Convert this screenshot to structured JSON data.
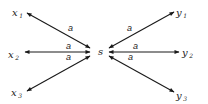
{
  "diagram": {
    "type": "bipartite-star-graph",
    "center": {
      "id": "s",
      "label": "s"
    },
    "nodes": [
      {
        "id": "x1",
        "base": "x",
        "sub": "1",
        "side": "left"
      },
      {
        "id": "x2",
        "base": "x",
        "sub": "2",
        "side": "left"
      },
      {
        "id": "x3",
        "base": "x",
        "sub": "3",
        "side": "left"
      },
      {
        "id": "y1",
        "base": "y",
        "sub": "1",
        "side": "right"
      },
      {
        "id": "y2",
        "base": "y",
        "sub": "2",
        "side": "right"
      },
      {
        "id": "y3",
        "base": "y",
        "sub": "3",
        "side": "right"
      }
    ],
    "edges": [
      {
        "from": "s",
        "to": "x1",
        "label": "a",
        "bidirectional": true
      },
      {
        "from": "s",
        "to": "x2",
        "label": "a",
        "bidirectional": true
      },
      {
        "from": "s",
        "to": "x3",
        "label": "a",
        "bidirectional": true
      },
      {
        "from": "s",
        "to": "y1",
        "label": "a",
        "bidirectional": true
      },
      {
        "from": "s",
        "to": "y2",
        "label": "a",
        "bidirectional": true
      },
      {
        "from": "s",
        "to": "y3",
        "label": "a",
        "bidirectional": true
      }
    ],
    "line_color": "#1a1a1a"
  }
}
